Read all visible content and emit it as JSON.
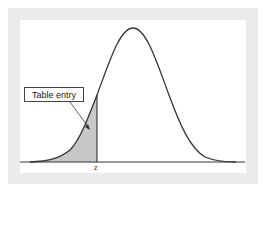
{
  "diagram": {
    "type": "standard-normal-curve",
    "callout_label": "Table entry",
    "axis_marker": "z",
    "shaded_region": "left tail area up to z",
    "colors": {
      "frame": "#ebebeb",
      "curve": "#333333",
      "shade": "#c8c8c8"
    }
  }
}
